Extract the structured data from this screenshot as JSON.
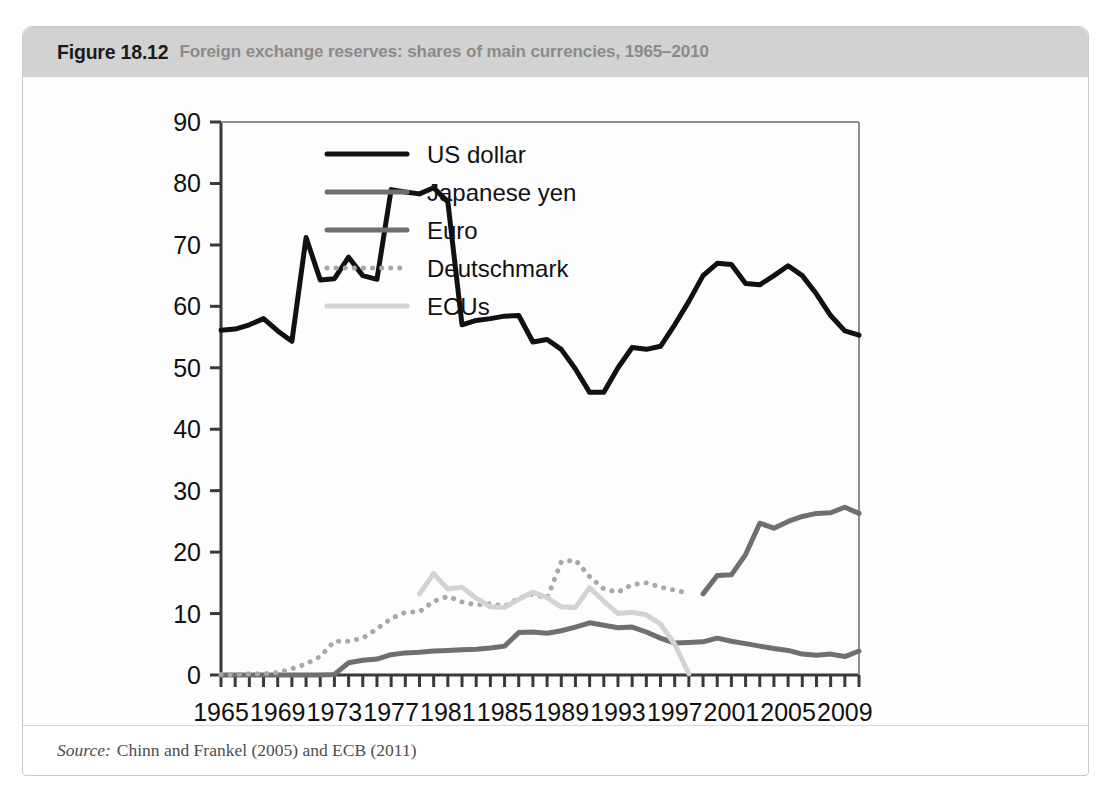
{
  "figure": {
    "number": "Figure 18.12",
    "caption": "Foreign exchange reserves: shares of main currencies, 1965–2010",
    "source_label": "Source:",
    "source_text": "Chinn and Frankel (2005) and ECB (2011)"
  },
  "chart_data": {
    "type": "line",
    "title": "Foreign exchange reserves: shares of main currencies, 1965–2010",
    "xlabel": "",
    "ylabel": "",
    "xlim": [
      1965,
      2010
    ],
    "ylim": [
      0,
      90
    ],
    "yticks": [
      0,
      10,
      20,
      30,
      40,
      50,
      60,
      70,
      80,
      90
    ],
    "ytick_labels": [
      "0",
      "10",
      "20",
      "30",
      "40",
      "50",
      "60",
      "70",
      "80",
      "90"
    ],
    "xticks": [
      1965,
      1966,
      1967,
      1968,
      1969,
      1970,
      1971,
      1972,
      1973,
      1974,
      1975,
      1976,
      1977,
      1978,
      1979,
      1980,
      1981,
      1982,
      1983,
      1984,
      1985,
      1986,
      1987,
      1988,
      1989,
      1990,
      1991,
      1992,
      1993,
      1994,
      1995,
      1996,
      1997,
      1998,
      1999,
      2000,
      2001,
      2002,
      2003,
      2004,
      2005,
      2006,
      2007,
      2008,
      2009,
      2010
    ],
    "xtick_labels_shown": [
      "1965",
      "1969",
      "1973",
      "1977",
      "1981",
      "1985",
      "1989",
      "1993",
      "1997",
      "2001",
      "2005",
      "2009"
    ],
    "grid": false,
    "legend_position": "top-center",
    "series": [
      {
        "name": "US dollar",
        "color": "#111111",
        "style": "solid",
        "width": 5,
        "x": [
          1965,
          1966,
          1967,
          1968,
          1969,
          1970,
          1971,
          1972,
          1973,
          1974,
          1975,
          1976,
          1977,
          1978,
          1979,
          1980,
          1981,
          1982,
          1983,
          1984,
          1985,
          1986,
          1987,
          1988,
          1989,
          1990,
          1991,
          1992,
          1993,
          1994,
          1995,
          1996,
          1997,
          1998,
          1999,
          2000,
          2001,
          2002,
          2003,
          2004,
          2005,
          2006,
          2007,
          2008,
          2009,
          2010
        ],
        "values": [
          56.1,
          56.3,
          57.0,
          58.0,
          56.0,
          54.3,
          71.2,
          64.3,
          64.5,
          68.0,
          65.0,
          64.4,
          79.0,
          78.6,
          78.3,
          79.3,
          77.0,
          57.0,
          57.7,
          58.0,
          58.4,
          58.5,
          54.2,
          54.6,
          53.0,
          49.8,
          46.0,
          46.0,
          50.0,
          53.3,
          53.0,
          53.5,
          57.0,
          60.8,
          65.0,
          67.0,
          66.8,
          63.7,
          63.5,
          65.0,
          66.6,
          65.0,
          62.0,
          58.5,
          56.0,
          55.3
        ]
      },
      {
        "name": "Japanese yen",
        "color": "#6f6f6f",
        "style": "solid",
        "width": 5,
        "x": [
          1965,
          1966,
          1967,
          1968,
          1969,
          1970,
          1971,
          1972,
          1973,
          1974,
          1975,
          1976,
          1977,
          1978,
          1979,
          1980,
          1981,
          1982,
          1983,
          1984,
          1985,
          1986,
          1987,
          1988,
          1989,
          1990,
          1991,
          1992,
          1993,
          1994,
          1995,
          1996,
          1997,
          1998,
          1999,
          2000,
          2001,
          2002,
          2003,
          2004,
          2005,
          2006,
          2007,
          2008,
          2009,
          2010
        ],
        "values": [
          0.0,
          0.0,
          0.0,
          0.0,
          0.0,
          0.0,
          0.0,
          0.0,
          0.1,
          2.0,
          2.4,
          2.6,
          3.3,
          3.6,
          3.7,
          3.9,
          4.0,
          4.1,
          4.2,
          4.4,
          4.7,
          6.9,
          7.0,
          6.8,
          7.2,
          7.8,
          8.5,
          8.1,
          7.7,
          7.8,
          7.0,
          6.0,
          5.2,
          5.3,
          5.4,
          6.0,
          5.5,
          5.1,
          4.7,
          4.3,
          4.0,
          3.4,
          3.2,
          3.4,
          3.0,
          3.9
        ]
      },
      {
        "name": "Euro",
        "color": "#6f6f6f",
        "style": "solid",
        "width": 5,
        "x": [
          1999,
          2000,
          2001,
          2002,
          2003,
          2004,
          2005,
          2006,
          2007,
          2008,
          2009,
          2010
        ],
        "values": [
          13.2,
          16.2,
          16.3,
          19.6,
          24.7,
          23.9,
          25.0,
          25.8,
          26.3,
          26.4,
          27.3,
          26.3
        ]
      },
      {
        "name": "Deutschmark",
        "color": "#a8a8a8",
        "style": "dotted",
        "width": 5,
        "x": [
          1965,
          1966,
          1967,
          1968,
          1969,
          1970,
          1971,
          1972,
          1973,
          1974,
          1975,
          1976,
          1977,
          1978,
          1979,
          1980,
          1981,
          1982,
          1983,
          1984,
          1985,
          1986,
          1987,
          1988,
          1989,
          1990,
          1991,
          1992,
          1993,
          1994,
          1995,
          1996,
          1997,
          1998
        ],
        "values": [
          0.1,
          0.1,
          0.2,
          0.2,
          0.4,
          1.0,
          1.8,
          3.0,
          5.5,
          5.5,
          6.0,
          7.5,
          9.2,
          10.2,
          10.3,
          12.0,
          12.8,
          11.9,
          11.4,
          11.6,
          11.2,
          12.5,
          13.2,
          12.5,
          18.4,
          18.7,
          16.0,
          14.0,
          13.5,
          14.7,
          15.0,
          14.3,
          13.8,
          13.3
        ]
      },
      {
        "name": "ECUs",
        "color": "#d3d3d3",
        "style": "solid",
        "width": 5,
        "x": [
          1979,
          1980,
          1981,
          1982,
          1983,
          1984,
          1985,
          1986,
          1987,
          1988,
          1989,
          1990,
          1991,
          1992,
          1993,
          1994,
          1995,
          1996,
          1997,
          1998
        ],
        "values": [
          13.2,
          16.5,
          14.0,
          14.3,
          12.5,
          11.1,
          11.0,
          12.3,
          13.5,
          12.6,
          11.1,
          11.0,
          14.2,
          12.0,
          10.0,
          10.2,
          9.8,
          8.3,
          5.0,
          0.2
        ]
      }
    ]
  },
  "legend": {
    "items": [
      {
        "label": "US dollar"
      },
      {
        "label": "Japanese yen"
      },
      {
        "label": "Euro"
      },
      {
        "label": "Deutschmark"
      },
      {
        "label": "ECUs"
      }
    ]
  }
}
